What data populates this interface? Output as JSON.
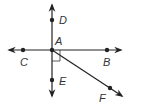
{
  "diagram": {
    "type": "geometry-lines-and-rays",
    "stroke_color": "#222222",
    "points": {
      "A": {
        "label": "A",
        "x": 52,
        "y": 50
      },
      "B": {
        "label": "B",
        "x": 107,
        "y": 50
      },
      "C": {
        "label": "C",
        "x": 23,
        "y": 50
      },
      "D": {
        "label": "D",
        "x": 52,
        "y": 20
      },
      "E": {
        "label": "E",
        "x": 52,
        "y": 80
      },
      "F": {
        "label": "F",
        "x": 110,
        "y": 88
      }
    },
    "labels": {
      "A": "A",
      "B": "B",
      "C": "C",
      "D": "D",
      "E": "E",
      "F": "F"
    },
    "elements": [
      {
        "kind": "line",
        "name": "line CB",
        "through": [
          "C",
          "A",
          "B"
        ]
      },
      {
        "kind": "line",
        "name": "line DE",
        "through": [
          "D",
          "A",
          "E"
        ]
      },
      {
        "kind": "ray",
        "name": "ray AF",
        "from": "A",
        "through": "F"
      },
      {
        "kind": "right-angle-marker",
        "at": "A",
        "between": [
          "AB",
          "AE"
        ]
      }
    ]
  }
}
